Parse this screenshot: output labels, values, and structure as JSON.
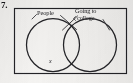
{
  "exercise": {
    "number": "7."
  },
  "figure": {
    "name": "venn-diagram",
    "type": "venn-two-set",
    "universe_box": {
      "label": "",
      "x": 14,
      "y": 8,
      "width": 113,
      "height": 66
    },
    "sets": [
      {
        "id": "left",
        "label": "People",
        "label_lines": [
          "People"
        ],
        "cx": 53,
        "cy": 45,
        "r": 27
      },
      {
        "id": "right",
        "label": "Going to college",
        "label_lines": [
          "Going to",
          "college"
        ],
        "cx": 90,
        "cy": 45,
        "r": 27
      }
    ],
    "markers": [
      {
        "id": "element-x",
        "text": "x",
        "region": "left-only",
        "x": 52,
        "y": 62
      }
    ],
    "leader_lines": [
      {
        "from": "label-people",
        "to": "right-circle-top-left",
        "x1": 62,
        "y1": 15,
        "x2": 76,
        "y2": 28
      },
      {
        "from": "label-college",
        "to": "left-circle-top-right",
        "x1": 77,
        "y1": 16,
        "x2": 63,
        "y2": 29
      },
      {
        "from": "label-college",
        "to": "right-circle-top",
        "x1": 103,
        "y1": 19,
        "x2": 110,
        "y2": 30
      },
      {
        "from": "label-people",
        "to": "left-circle-top",
        "x1": 37,
        "y1": 14,
        "x2": 32,
        "y2": 20
      }
    ],
    "colors": {
      "ink": "#1d1d20",
      "paper": "#f4f3f1",
      "stroke": "#232327"
    }
  }
}
